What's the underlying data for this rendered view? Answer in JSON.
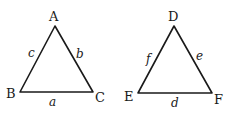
{
  "triangles": [
    {
      "name": "ABC",
      "vertices": [
        "A",
        "B",
        "C"
      ],
      "sides": {
        "opposite_A": "a",
        "opposite_B": "b",
        "opposite_C": "c"
      }
    },
    {
      "name": "DEF",
      "vertices": [
        "D",
        "E",
        "F"
      ],
      "sides": {
        "opposite_D": "d",
        "opposite_E": "e",
        "opposite_F": "f"
      }
    }
  ],
  "labels": {
    "A": "A",
    "B": "B",
    "C": "C",
    "a": "a",
    "b": "b",
    "c": "c",
    "D": "D",
    "E": "E",
    "F": "F",
    "d": "d",
    "e": "e",
    "f": "f"
  }
}
